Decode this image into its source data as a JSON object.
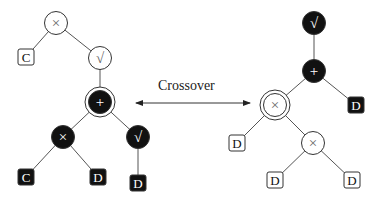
{
  "diagram": {
    "arrow_label": "Crossover",
    "colors": {
      "dark": "#111111",
      "light": "#ffffff",
      "edge": "#555555",
      "stroke": "#333333",
      "light_glyph": "#666666"
    },
    "left_tree": {
      "nodes": [
        {
          "id": "L1",
          "type": "op",
          "glyph": "×",
          "x": 56,
          "y": 23,
          "dark": false,
          "ring": false
        },
        {
          "id": "L2",
          "type": "term",
          "glyph": "C",
          "x": 26,
          "y": 57,
          "dark": false
        },
        {
          "id": "L3",
          "type": "op",
          "glyph": "√",
          "x": 100,
          "y": 58,
          "dark": false,
          "ring": false
        },
        {
          "id": "L4",
          "type": "op",
          "glyph": "+",
          "x": 100,
          "y": 102,
          "dark": true,
          "ring": true
        },
        {
          "id": "L5",
          "type": "op",
          "glyph": "×",
          "x": 63,
          "y": 137,
          "dark": true,
          "ring": false
        },
        {
          "id": "L6",
          "type": "op",
          "glyph": "√",
          "x": 138,
          "y": 137,
          "dark": true,
          "ring": false
        },
        {
          "id": "L7",
          "type": "term",
          "glyph": "C",
          "x": 26,
          "y": 177,
          "dark": true
        },
        {
          "id": "L8",
          "type": "term",
          "glyph": "D",
          "x": 98,
          "y": 177,
          "dark": true
        },
        {
          "id": "L9",
          "type": "term",
          "glyph": "D",
          "x": 138,
          "y": 183,
          "dark": true
        }
      ],
      "edges": [
        [
          "L1",
          "L2"
        ],
        [
          "L1",
          "L3"
        ],
        [
          "L3",
          "L4"
        ],
        [
          "L4",
          "L5"
        ],
        [
          "L4",
          "L6"
        ],
        [
          "L5",
          "L7"
        ],
        [
          "L5",
          "L8"
        ],
        [
          "L6",
          "L9"
        ]
      ]
    },
    "right_tree": {
      "nodes": [
        {
          "id": "R1",
          "type": "op",
          "glyph": "√",
          "x": 314,
          "y": 23,
          "dark": true,
          "ring": false
        },
        {
          "id": "R2",
          "type": "op",
          "glyph": "+",
          "x": 314,
          "y": 71,
          "dark": true,
          "ring": false
        },
        {
          "id": "R3",
          "type": "op",
          "glyph": "×",
          "x": 275,
          "y": 105,
          "dark": false,
          "ring": true
        },
        {
          "id": "R4",
          "type": "term",
          "glyph": "D",
          "x": 356,
          "y": 105,
          "dark": true
        },
        {
          "id": "R5",
          "type": "term",
          "glyph": "D",
          "x": 237,
          "y": 143,
          "dark": false
        },
        {
          "id": "R6",
          "type": "op",
          "glyph": "×",
          "x": 313,
          "y": 143,
          "dark": false,
          "ring": false
        },
        {
          "id": "R7",
          "type": "term",
          "glyph": "D",
          "x": 275,
          "y": 180,
          "dark": false
        },
        {
          "id": "R8",
          "type": "term",
          "glyph": "D",
          "x": 352,
          "y": 180,
          "dark": false
        }
      ],
      "edges": [
        [
          "R1",
          "R2"
        ],
        [
          "R2",
          "R3"
        ],
        [
          "R2",
          "R4"
        ],
        [
          "R3",
          "R5"
        ],
        [
          "R3",
          "R6"
        ],
        [
          "R6",
          "R7"
        ],
        [
          "R6",
          "R8"
        ]
      ]
    }
  }
}
